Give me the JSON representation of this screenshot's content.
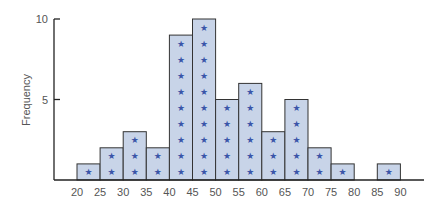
{
  "chart_data": {
    "type": "bar",
    "subtype": "histogram-dotplot",
    "title": "",
    "xlabel": "",
    "ylabel": "Frequency",
    "bins": [
      {
        "from": 20,
        "to": 25,
        "count": 1
      },
      {
        "from": 25,
        "to": 30,
        "count": 2
      },
      {
        "from": 30,
        "to": 35,
        "count": 3
      },
      {
        "from": 35,
        "to": 40,
        "count": 2
      },
      {
        "from": 40,
        "to": 45,
        "count": 9
      },
      {
        "from": 45,
        "to": 50,
        "count": 10
      },
      {
        "from": 50,
        "to": 55,
        "count": 5
      },
      {
        "from": 55,
        "to": 60,
        "count": 6
      },
      {
        "from": 60,
        "to": 65,
        "count": 3
      },
      {
        "from": 65,
        "to": 70,
        "count": 5
      },
      {
        "from": 70,
        "to": 75,
        "count": 2
      },
      {
        "from": 75,
        "to": 80,
        "count": 1
      },
      {
        "from": 80,
        "to": 85,
        "count": 0
      },
      {
        "from": 85,
        "to": 90,
        "count": 1
      }
    ],
    "categories": [
      "20-25",
      "25-30",
      "30-35",
      "35-40",
      "40-45",
      "45-50",
      "50-55",
      "55-60",
      "60-65",
      "65-70",
      "70-75",
      "75-80",
      "80-85",
      "85-90"
    ],
    "values": [
      1,
      2,
      3,
      2,
      9,
      10,
      5,
      6,
      3,
      5,
      2,
      1,
      0,
      1
    ],
    "x_tick_labels": [
      "20",
      "25",
      "30",
      "35",
      "40",
      "45",
      "50",
      "55",
      "60",
      "65",
      "70",
      "75",
      "80",
      "85",
      "90"
    ],
    "y_tick_labels": [
      "5",
      "10"
    ],
    "y_ticks": [
      5,
      10
    ],
    "ylim": [
      0,
      10
    ],
    "xlim": [
      20,
      90
    ],
    "grid": false,
    "legend": null,
    "marker": "★",
    "colors": {
      "bar_fill": "#c8d4e8",
      "bar_stroke": "#333333",
      "marker": "#3a55a8",
      "axis": "#222222"
    }
  }
}
